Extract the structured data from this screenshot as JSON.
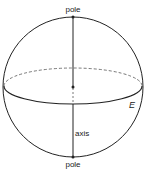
{
  "diagram": {
    "type": "sphere-with-axis",
    "labels": {
      "top_pole": "pole",
      "bottom_pole": "pole",
      "axis": "axis",
      "equator": "E"
    },
    "colors": {
      "stroke": "#222222",
      "dashed": "#555555",
      "background": "#ffffff"
    }
  }
}
